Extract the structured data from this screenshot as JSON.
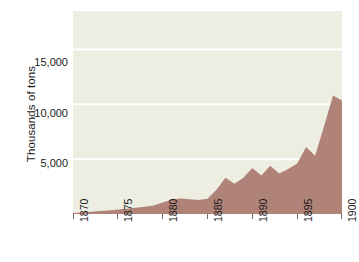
{
  "chart_data": {
    "type": "area",
    "title": "",
    "xlabel": "",
    "ylabel": "Thousands of tons",
    "xlim": [
      1870,
      1900
    ],
    "ylim": [
      0,
      18500
    ],
    "grid": true,
    "legend": "none",
    "series_color": "#b08378",
    "plot_background": "#edeee1",
    "gridline_color": "#ffffff",
    "y_ticks": [
      5000,
      10000,
      15000
    ],
    "y_tick_labels": [
      "5,000",
      "10,000",
      "15,000"
    ],
    "x_ticks": [
      1870,
      1875,
      1880,
      1885,
      1890,
      1895,
      1900
    ],
    "x_tick_labels": [
      "1870",
      "1875",
      "1880",
      "1885",
      "1890",
      "1895",
      "1900"
    ],
    "x": [
      1870,
      1871,
      1872,
      1873,
      1874,
      1875,
      1876,
      1877,
      1878,
      1879,
      1880,
      1881,
      1882,
      1883,
      1884,
      1885,
      1886,
      1887,
      1888,
      1889,
      1890,
      1891,
      1892,
      1893,
      1894,
      1895,
      1896,
      1897,
      1898,
      1899,
      1900
    ],
    "values": [
      80,
      130,
      200,
      270,
      330,
      400,
      480,
      560,
      650,
      780,
      1050,
      1300,
      1420,
      1350,
      1280,
      1400,
      2200,
      3300,
      2750,
      3300,
      4200,
      3500,
      4400,
      3700,
      4100,
      4600,
      6100,
      5300,
      8000,
      10800,
      10350
    ],
    "series": [
      {
        "name": "Production",
        "values": [
          80,
          130,
          200,
          270,
          330,
          400,
          480,
          560,
          650,
          780,
          1050,
          1300,
          1420,
          1350,
          1280,
          1400,
          2200,
          3300,
          2750,
          3300,
          4200,
          3500,
          4400,
          3700,
          4100,
          4600,
          6100,
          5300,
          8000,
          10800,
          10350
        ]
      }
    ]
  },
  "axis": {
    "y_title": "Thousands of tons",
    "y_tick_labels": [
      "15,000",
      "10,000",
      "5,000"
    ],
    "x_tick_labels": [
      "1870",
      "1875",
      "1880",
      "1885",
      "1890",
      "1895",
      "1900"
    ]
  }
}
